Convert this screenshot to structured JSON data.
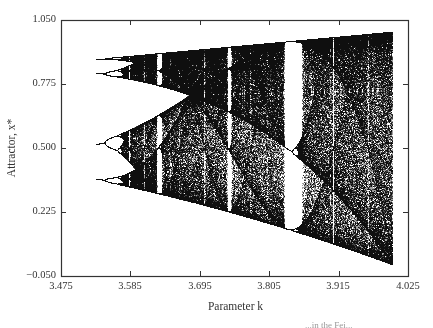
{
  "chart_data": {
    "type": "scatter",
    "title": "",
    "subtitle": "Logistic map bifurcation diagram",
    "xlabel": "Parameter k",
    "ylabel": "Attractor, x*",
    "xlim": [
      3.475,
      4.025
    ],
    "ylim": [
      -0.05,
      1.05
    ],
    "x_ticks": [
      "3.475",
      "3.585",
      "3.695",
      "3.805",
      "3.915",
      "4.025"
    ],
    "y_ticks": [
      "1.050",
      "0.775",
      "0.500",
      "0.225",
      "−0.050"
    ],
    "grid": false,
    "legend": null,
    "map": "x_{n+1} = k x_n (1 - x_n)",
    "k_range_plotted": [
      3.53,
      4.0
    ],
    "features": {
      "period_4_region": [
        3.53,
        3.544
      ],
      "period_8_region": [
        3.544,
        3.5644
      ],
      "onset_of_chaos": 3.5699,
      "period_6_window": 3.6275,
      "period_5_window": 3.7385,
      "period_3_window": [
        3.8284,
        3.857
      ],
      "band_merge_point": 3.6786,
      "max_attractor_at_k4": 1.0,
      "min_attractor_at_k4": 0.0
    },
    "series": [
      {
        "name": "attractor points",
        "color": "#111111"
      }
    ]
  },
  "caption_fragment": "...in the Fei..."
}
